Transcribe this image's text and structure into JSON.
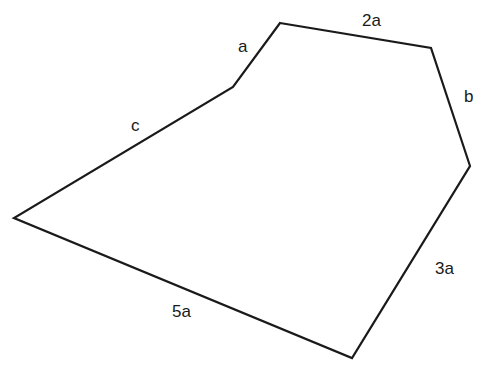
{
  "diagram": {
    "type": "hexagon",
    "stroke_color": "#1a1a1a",
    "background": "#ffffff",
    "sides": [
      {
        "label": "a"
      },
      {
        "label": "2a"
      },
      {
        "label": "b"
      },
      {
        "label": "3a"
      },
      {
        "label": "5a"
      },
      {
        "label": "c"
      }
    ]
  }
}
